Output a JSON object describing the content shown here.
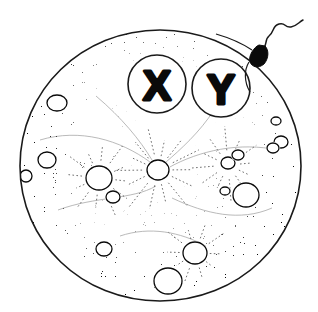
{
  "figure": {
    "title": "Ovum with X and Y chromosome markers and attaching spermatozoon",
    "background_color": "#ffffff",
    "ink_color": "#0a0a0a",
    "canvas": {
      "width": 318,
      "height": 312
    }
  },
  "cell": {
    "name": "ovum",
    "outline_color": "#1a1a1a",
    "fill_color": "#ffffff",
    "bounds": {
      "left": 20,
      "top": 30,
      "right": 301,
      "bottom": 301
    },
    "center": {
      "x": 160,
      "y": 166
    },
    "radius_x": 140,
    "radius_y": 136,
    "cytoplasm_texture": "stipple"
  },
  "chromosomes": [
    {
      "id": "x-chromosome",
      "label": "X",
      "center": {
        "x": 157,
        "y": 84
      },
      "radius": 29,
      "ring_color": "#1a1a1a",
      "glyph_color": "#0a0a0a"
    },
    {
      "id": "y-chromosome",
      "label": "Y",
      "center": {
        "x": 221,
        "y": 88
      },
      "radius": 29,
      "ring_color": "#1a1a1a",
      "glyph_color": "#0a0a0a"
    }
  ],
  "sperm": {
    "name": "spermatozoon",
    "head": {
      "x": 259,
      "y": 55,
      "width": 13,
      "height": 19,
      "color": "#0a0a0a"
    },
    "tail_description": "wavy flagellum extending up and to the right",
    "tail_end": {
      "x": 303,
      "y": 26
    },
    "neck_contact": {
      "x": 252,
      "y": 64
    }
  },
  "vacuoles": [
    {
      "cx": 57,
      "cy": 103,
      "rx": 10,
      "ry": 8
    },
    {
      "cx": 47,
      "cy": 160,
      "rx": 9,
      "ry": 8
    },
    {
      "cx": 26,
      "cy": 176,
      "rx": 6,
      "ry": 6
    },
    {
      "cx": 99,
      "cy": 178,
      "rx": 13,
      "ry": 12
    },
    {
      "cx": 113,
      "cy": 197,
      "rx": 7,
      "ry": 6
    },
    {
      "cx": 158,
      "cy": 170,
      "rx": 11,
      "ry": 10
    },
    {
      "cx": 228,
      "cy": 163,
      "rx": 7,
      "ry": 6
    },
    {
      "cx": 238,
      "cy": 155,
      "rx": 6,
      "ry": 5
    },
    {
      "cx": 281,
      "cy": 142,
      "rx": 7,
      "ry": 6
    },
    {
      "cx": 273,
      "cy": 148,
      "rx": 6,
      "ry": 5
    },
    {
      "cx": 246,
      "cy": 195,
      "rx": 13,
      "ry": 12
    },
    {
      "cx": 225,
      "cy": 191,
      "rx": 5,
      "ry": 4
    },
    {
      "cx": 104,
      "cy": 249,
      "rx": 8,
      "ry": 7
    },
    {
      "cx": 195,
      "cy": 253,
      "rx": 12,
      "ry": 11
    },
    {
      "cx": 168,
      "cy": 281,
      "rx": 14,
      "ry": 13
    },
    {
      "cx": 276,
      "cy": 121,
      "rx": 5,
      "ry": 4
    }
  ],
  "asters": [
    {
      "cx": 158,
      "cy": 170,
      "rays": 14,
      "inner": 14,
      "outer": 46
    },
    {
      "cx": 99,
      "cy": 178,
      "rays": 12,
      "inner": 16,
      "outer": 40
    },
    {
      "cx": 228,
      "cy": 165,
      "rays": 12,
      "inner": 12,
      "outer": 38
    },
    {
      "cx": 195,
      "cy": 253,
      "rays": 10,
      "inner": 14,
      "outer": 34
    }
  ]
}
